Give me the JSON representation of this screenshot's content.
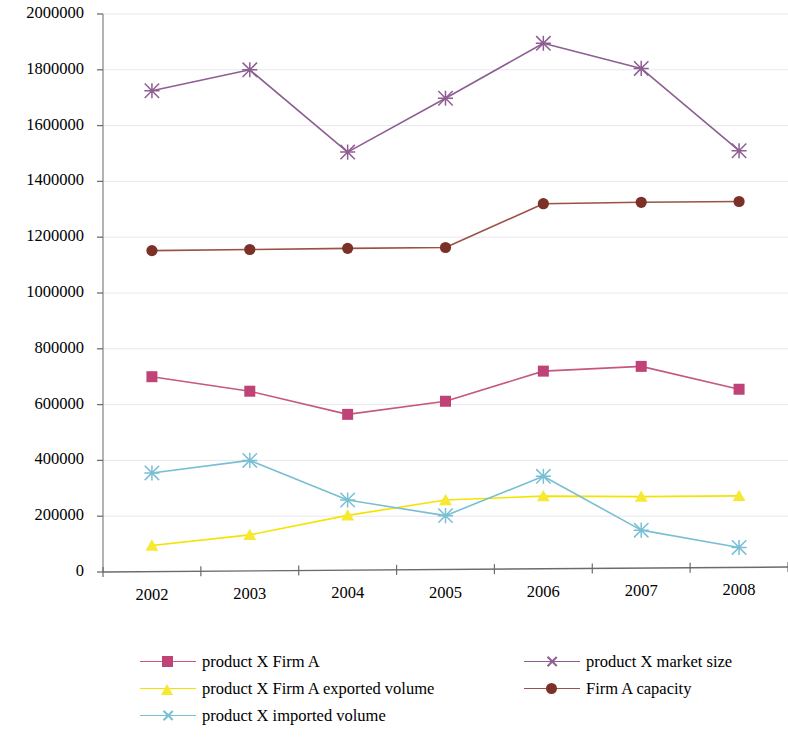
{
  "chart_data": {
    "type": "line",
    "title": "",
    "subtitle": "",
    "xlabel": "",
    "ylabel": "",
    "categories": [
      "2002",
      "2003",
      "2004",
      "2005",
      "2006",
      "2007",
      "2008"
    ],
    "ylim": [
      0,
      2000000
    ],
    "ytick_labels": [
      "0",
      "200000",
      "400000",
      "600000",
      "800000",
      "1000000",
      "1200000",
      "1400000",
      "1600000",
      "1800000",
      "2000000"
    ],
    "ytick_values": [
      0,
      200000,
      400000,
      600000,
      800000,
      1000000,
      1200000,
      1400000,
      1600000,
      1800000,
      2000000
    ],
    "ytick_step": 200000,
    "grid": true,
    "legend_position": "bottom",
    "series": [
      {
        "name": "product X Firm A",
        "marker": "square",
        "color": "#C04378",
        "line_color": "#C4587F",
        "values": [
          700000,
          648000,
          565000,
          612000,
          720000,
          737000,
          655000
        ]
      },
      {
        "name": "product X Firm A exported volume",
        "marker": "triangle",
        "color": "#F7E832",
        "line_color": "#F3E400",
        "values": [
          95000,
          133000,
          203000,
          258000,
          272000,
          270000,
          273000
        ]
      },
      {
        "name": "product X imported volume",
        "marker": "x",
        "color": "#79BFD4",
        "line_color": "#79BFD4",
        "values": [
          355000,
          400000,
          258000,
          202000,
          343000,
          150000,
          88000
        ]
      },
      {
        "name": "product X market size",
        "marker": "x",
        "color": "#8E5E93",
        "line_color": "#8E5E93",
        "values": [
          1725000,
          1800000,
          1505000,
          1698000,
          1895000,
          1805000,
          1510000
        ]
      },
      {
        "name": "Firm A capacity",
        "marker": "circle",
        "color": "#7B3028",
        "line_color": "#9A5248",
        "values": [
          1152000,
          1156000,
          1160000,
          1163000,
          1320000,
          1325000,
          1328000
        ]
      }
    ],
    "legend_columns": [
      [
        "product X Firm A",
        "product X Firm A exported volume",
        "product X imported volume"
      ],
      [
        "product X market size",
        "Firm A capacity"
      ]
    ]
  },
  "axis": {
    "y_axis_name": "value-axis",
    "x_axis_name": "category-axis"
  }
}
